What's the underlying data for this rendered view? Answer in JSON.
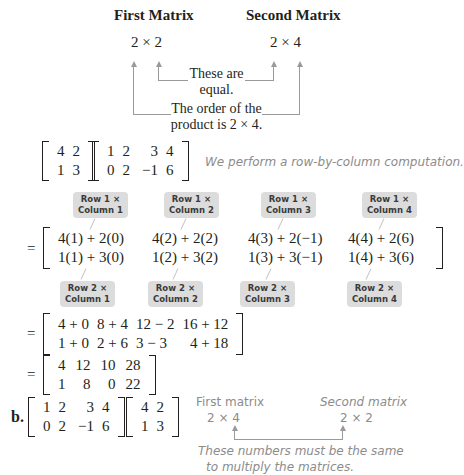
{
  "part_a_header": {
    "first_label": "First Matrix",
    "second_label": "Second Matrix",
    "first_dim": "2 × 2",
    "second_dim": "2 × 4",
    "note_equal": "These are equal.",
    "note_equal_line1": "These are",
    "note_equal_line2": "equal.",
    "note_order_line1": "The order of the",
    "note_order_line2": "product is 2 × 4."
  },
  "product_a": {
    "left": [
      [
        "4",
        "2"
      ],
      [
        "1",
        "3"
      ]
    ],
    "right": [
      [
        "1",
        "2",
        "3",
        "4"
      ],
      [
        "0",
        "2",
        "−1",
        "6"
      ]
    ],
    "comment": "We perform a row-by-column computation."
  },
  "callouts_row1": [
    {
      "line1": "Row 1 ×",
      "line2": "Column 1"
    },
    {
      "line1": "Row 1 ×",
      "line2": "Column 2"
    },
    {
      "line1": "Row 1 ×",
      "line2": "Column 3"
    },
    {
      "line1": "Row 1 ×",
      "line2": "Column 4"
    }
  ],
  "step1": {
    "eq": "=",
    "rows": [
      [
        "4(1) + 2(0)",
        "4(2) + 2(2)",
        "4(3) + 2(−1)",
        "4(4) + 2(6)"
      ],
      [
        "1(1) + 3(0)",
        "1(2) + 3(2)",
        "1(3) + 3(−1)",
        "1(4) + 3(6)"
      ]
    ]
  },
  "callouts_row2": [
    {
      "line1": "Row 2 ×",
      "line2": "Column 1"
    },
    {
      "line1": "Row 2 ×",
      "line2": "Column 2"
    },
    {
      "line1": "Row 2 ×",
      "line2": "Column 3"
    },
    {
      "line1": "Row 2 ×",
      "line2": "Column 4"
    }
  ],
  "step2": {
    "eq": "=",
    "rows": [
      [
        "4 + 0",
        "8 + 4",
        "12 − 2",
        "16 + 12"
      ],
      [
        "1 + 0",
        "2 + 6",
        "3 − 3",
        "4 + 18"
      ]
    ]
  },
  "result": {
    "eq": "=",
    "rows": [
      [
        "4",
        "12",
        "10",
        "28"
      ],
      [
        "1",
        "8",
        "0",
        "22"
      ]
    ]
  },
  "part_b": {
    "label": "b.",
    "left": [
      [
        "1",
        "2",
        "3",
        "4"
      ],
      [
        "0",
        "2",
        "−1",
        "6"
      ]
    ],
    "right": [
      [
        "4",
        "2"
      ],
      [
        "1",
        "3"
      ]
    ],
    "first_label": "First matrix",
    "second_label": "Second matrix",
    "first_dim": "2 × 4",
    "second_dim": "2 × 2",
    "note_line1": "These numbers must be the same",
    "note_line2": "to multiply the matrices."
  }
}
